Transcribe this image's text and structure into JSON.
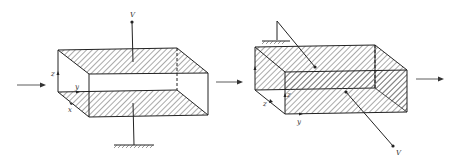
{
  "diagram": {
    "left_figure": {
      "axis_labels": {
        "z": "z",
        "y": "y",
        "x": "x"
      },
      "terminal_label": "V",
      "hatched_faces": [
        "top-plate",
        "bottom-plate"
      ],
      "ground": "bottom"
    },
    "right_figure": {
      "axis_labels": {
        "z": "z",
        "y": "y",
        "x": "z"
      },
      "terminal_label": "V",
      "hatched_faces": [
        "back-plate",
        "front-plate"
      ],
      "ground": "top-left"
    },
    "colors": {
      "line": "#2a2a2a",
      "hatch": "#555555",
      "background": "#ffffff"
    }
  }
}
